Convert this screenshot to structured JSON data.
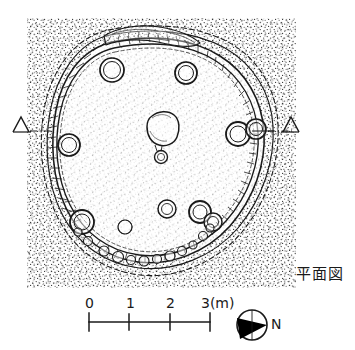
{
  "figure": {
    "title_label": "平面図",
    "title_meaning": "plan-view",
    "background_color": "#ffffff",
    "ink_color": "#1a1a1a",
    "stipple": {
      "name": "stipple-fill",
      "x": 27,
      "y": 18,
      "width": 269,
      "height": 270,
      "dot_color": "#2b2b2b"
    }
  },
  "scale_bar": {
    "name": "scale-bar",
    "ticks": [
      "0",
      "1",
      "2",
      "3(m)"
    ],
    "tick_values": [
      0,
      1,
      2,
      3
    ],
    "unit": "m",
    "x_start": 89,
    "x_end": 210,
    "y_axis": 322,
    "label_y": 300
  },
  "compass": {
    "name": "compass-rose",
    "label": "N",
    "direction": "right",
    "center_x": 252,
    "center_y": 325,
    "radius": 15,
    "fill_color": "#000000"
  },
  "section_markers": [
    {
      "name": "section-marker-left",
      "glyph": "Δ",
      "x": 20,
      "y": 126,
      "side": "left"
    },
    {
      "name": "section-marker-right",
      "glyph": "Δ",
      "x": 290,
      "y": 126,
      "side": "right"
    }
  ],
  "structure": {
    "name": "pit-dwelling-outline",
    "type": "sub-circular pit dwelling floor plan",
    "wall_line": "solid inner floor edge with outer dashed berm line"
  },
  "features": {
    "postholes": [
      {
        "name": "posthole-nw",
        "cx": 112,
        "cy": 70,
        "r": 12
      },
      {
        "name": "posthole-ne",
        "cx": 186,
        "cy": 73,
        "r": 11
      },
      {
        "name": "posthole-w",
        "cx": 69,
        "cy": 145,
        "r": 11
      },
      {
        "name": "posthole-e-outer",
        "cx": 238,
        "cy": 134,
        "r": 12
      },
      {
        "name": "posthole-e-inner",
        "cx": 256,
        "cy": 130,
        "r": 10
      },
      {
        "name": "posthole-sw",
        "cx": 82,
        "cy": 222,
        "r": 12
      },
      {
        "name": "posthole-s-center",
        "cx": 167,
        "cy": 210,
        "r": 9
      },
      {
        "name": "posthole-se-a",
        "cx": 200,
        "cy": 212,
        "r": 11
      },
      {
        "name": "posthole-se-b",
        "cx": 212,
        "cy": 222,
        "r": 9
      },
      {
        "name": "posthole-sw-small",
        "cx": 125,
        "cy": 227,
        "r": 7
      }
    ],
    "hearth": {
      "name": "central-hearth",
      "cx": 163,
      "cy": 128,
      "rx": 15,
      "ry": 14
    },
    "hearth_satellite": {
      "name": "hearth-satellite-pit",
      "cx": 161,
      "cy": 156,
      "r": 6
    },
    "wall_trench": {
      "name": "north-wall-trench",
      "description": "elongated trench along north wall"
    },
    "wall_pits": {
      "name": "south-wall-pit-cluster",
      "description": "small pits along south wall arc"
    }
  }
}
